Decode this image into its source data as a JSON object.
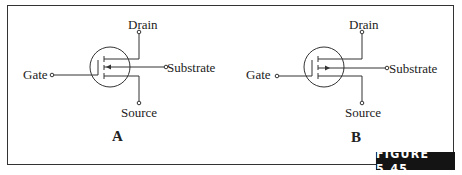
{
  "figure": {
    "label": "FIGURE 5.45",
    "panels": [
      {
        "id": "A",
        "caption": "A",
        "terminals": {
          "drain": "Drain",
          "gate": "Gate",
          "substrate": "Substrate",
          "source": "Source"
        },
        "substrate_arrow": "pointing-inward"
      },
      {
        "id": "B",
        "caption": "B",
        "terminals": {
          "drain": "Drain",
          "gate": "Gate",
          "substrate": "Substrate",
          "source": "Source"
        },
        "substrate_arrow": "pointing-outward"
      }
    ]
  }
}
